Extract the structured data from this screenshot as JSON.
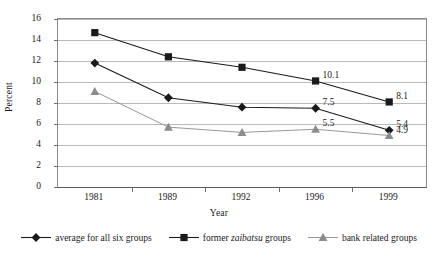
{
  "chart_data": {
    "type": "line",
    "title": "",
    "xlabel": "Year",
    "ylabel": "Percent",
    "categories": [
      "1981",
      "1989",
      "1992",
      "1996",
      "1999"
    ],
    "ylim": [
      0,
      16
    ],
    "yticks": [
      0,
      2,
      4,
      6,
      8,
      10,
      12,
      14,
      16
    ],
    "ytick_labels": [
      "0",
      "2",
      "4",
      "6",
      "8",
      "10",
      "12",
      "14",
      "16"
    ],
    "grid": true,
    "legend_position": "bottom",
    "series": [
      {
        "name": "average for all six groups",
        "marker": "diamond",
        "color": "#1a1a1a",
        "values": [
          11.8,
          8.5,
          7.6,
          7.5,
          5.4
        ],
        "point_labels": [
          "",
          "",
          "",
          "7.5",
          "5.4"
        ]
      },
      {
        "name": "former zaibatsu groups",
        "marker": "square",
        "color": "#1a1a1a",
        "values": [
          14.7,
          12.4,
          11.4,
          10.1,
          8.1
        ],
        "point_labels": [
          "",
          "",
          "",
          "10.1",
          "8.1"
        ]
      },
      {
        "name": "bank related groups",
        "marker": "triangle",
        "color": "#8c8c8c",
        "values": [
          9.1,
          5.7,
          5.2,
          5.5,
          4.9
        ],
        "point_labels": [
          "",
          "",
          "",
          "5.5",
          "4.9"
        ]
      }
    ],
    "annotations": [
      "10.1",
      "8.1",
      "7.5",
      "5.4",
      "5.5",
      "4.9"
    ]
  },
  "legend": {
    "items": [
      {
        "label_pre": "average for all six groups",
        "label_italic": "",
        "label_post": ""
      },
      {
        "label_pre": "former ",
        "label_italic": "zaibatsu",
        "label_post": " groups"
      },
      {
        "label_pre": "bank related groups",
        "label_italic": "",
        "label_post": ""
      }
    ]
  }
}
